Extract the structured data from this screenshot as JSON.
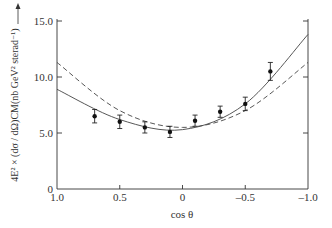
{
  "chart_data": {
    "type": "scatter",
    "title": "",
    "xlabel": "cos θ",
    "ylabel": "4E² × (dσ / dΩ)CM(nb GeV² sterad⁻¹)",
    "xlim": [
      1.0,
      -1.0
    ],
    "ylim": [
      0,
      15.0
    ],
    "x_ticks": [
      "1.0",
      "0.5",
      "0",
      "-0.5",
      "-1.0"
    ],
    "y_ticks": [
      "0",
      "5.0",
      "10.0",
      "15.0"
    ],
    "grid": false,
    "series": [
      {
        "name": "data",
        "style": "points-with-errorbars",
        "x": [
          0.7,
          0.5,
          0.3,
          0.1,
          -0.1,
          -0.3,
          -0.5,
          -0.7
        ],
        "y": [
          6.5,
          6.0,
          5.5,
          5.1,
          6.1,
          6.9,
          7.6,
          10.5
        ],
        "err": [
          0.6,
          0.6,
          0.5,
          0.5,
          0.5,
          0.5,
          0.6,
          0.8
        ]
      },
      {
        "name": "solid-curve",
        "style": "solid",
        "x": [
          1.0,
          0.5,
          0.0,
          -0.5,
          -1.0
        ],
        "y": [
          8.9,
          6.2,
          5.3,
          7.6,
          13.8
        ]
      },
      {
        "name": "dashed-curve",
        "style": "dashed",
        "x": [
          1.0,
          0.5,
          0.0,
          -0.5,
          -1.0
        ],
        "y": [
          11.3,
          7.0,
          5.5,
          7.0,
          11.3
        ]
      }
    ]
  }
}
